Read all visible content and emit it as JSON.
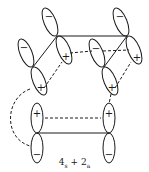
{
  "diagram": {
    "caption": {
      "term1_coef": "4",
      "term1_sub": "s",
      "plus": "+",
      "term2_coef": "2",
      "term2_sub": "a"
    },
    "signs": {
      "A_upper": "−",
      "A_lower": "+",
      "B_upper": "−",
      "B_lower": "+",
      "C_upper": "−",
      "C_lower": "+",
      "D_upper": "−",
      "D_lower": "+",
      "E_upper": "+",
      "E_lower": "−",
      "F_upper": "+",
      "F_lower": "−"
    },
    "colors": {
      "ink": "#1a1a1a",
      "background": "#ffffff"
    }
  }
}
